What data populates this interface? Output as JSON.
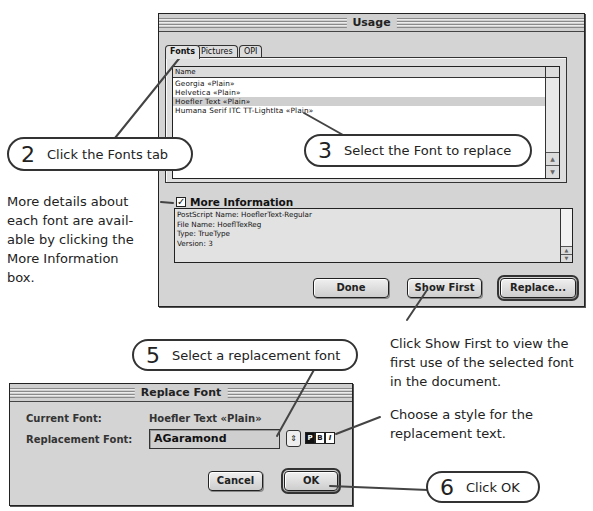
{
  "usage_window": {
    "title": "Usage",
    "tabs": [
      {
        "label": "Fonts",
        "active": true
      },
      {
        "label": "Pictures",
        "active": false
      },
      {
        "label": "OPI",
        "active": false
      }
    ],
    "list": {
      "column_header": "Name",
      "rows": [
        {
          "label": "Georgia «Plain»",
          "selected": false
        },
        {
          "label": "Helvetica «Plain»",
          "selected": false
        },
        {
          "label": "Hoefler Text «Plain»",
          "selected": true
        },
        {
          "label": "Humana Serif ITC TT-LightIta «Plain»",
          "selected": false
        }
      ]
    },
    "more_information": {
      "label": "More Information",
      "checked": true,
      "lines": [
        "PostScript Name: HoeflerText-Regular",
        "File Name: HoeflTexReg",
        "Type: TrueType",
        "Version: 3"
      ]
    },
    "buttons": {
      "done": "Done",
      "show_first": "Show First",
      "replace": "Replace..."
    }
  },
  "replace_dialog": {
    "title": "Replace Font",
    "current_font_label": "Current Font:",
    "current_font_value": "Hoefler Text «Plain»",
    "replacement_font_label": "Replacement Font:",
    "replacement_font_value": "AGaramond",
    "style_buttons": [
      {
        "label": "P",
        "selected": true
      },
      {
        "label": "B",
        "selected": false
      },
      {
        "label": "I",
        "selected": false
      }
    ],
    "buttons": {
      "cancel": "Cancel",
      "ok": "OK"
    }
  },
  "callouts": {
    "step2": {
      "num": "2",
      "text": "Click the Fonts tab"
    },
    "step3": {
      "num": "3",
      "text": "Select the Font to replace"
    },
    "step5": {
      "num": "5",
      "text": "Select a replacement font"
    },
    "step6": {
      "num": "6",
      "text": "Click OK"
    }
  },
  "notes": {
    "more_info": [
      "More details about",
      "each font are avail-",
      "able by clicking the",
      "More Information",
      "box."
    ],
    "show_first": [
      "Click Show First to view the",
      "first use of the selected font",
      "in the document."
    ],
    "style": [
      "Choose a style for the",
      "replacement text."
    ]
  },
  "icons": {
    "checkbox_check": "✓",
    "scroll_up": "▲",
    "scroll_down": "▼",
    "stepper": "⇕"
  }
}
